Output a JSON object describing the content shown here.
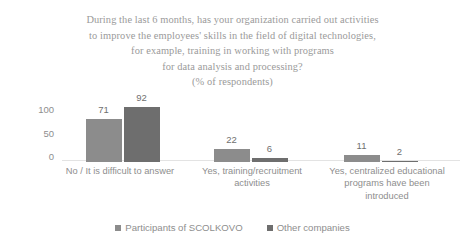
{
  "chart_data": {
    "type": "bar",
    "title_lines": [
      "During the last 6 months, has your organization carried out activities",
      "to improve the employees' skills in the field of digital technologies,",
      "for example, training in working with programs",
      "for data analysis and processing?",
      "(% of respondents)"
    ],
    "xlabel": "",
    "ylabel": "",
    "ylim": [
      0,
      100
    ],
    "yticks": [
      "0",
      "50",
      "100"
    ],
    "grid": false,
    "legend_position": "bottom",
    "categories": [
      "No / It is difficult to answer",
      "Yes, training/recruitment activities",
      "Yes, centralized educational programs have been introduced"
    ],
    "category_lines": [
      [
        "No / It is difficult to answer"
      ],
      [
        "Yes, training/recruitment",
        "activities"
      ],
      [
        "Yes, centralized educational",
        "programs have been",
        "introduced"
      ]
    ],
    "series": [
      {
        "name": "Participants of SCOLKOVO",
        "color": "#8c8c8c",
        "values": [
          71,
          22,
          11
        ]
      },
      {
        "name": "Other companies",
        "color": "#6e6e6e",
        "values": [
          92,
          6,
          2
        ]
      }
    ]
  }
}
